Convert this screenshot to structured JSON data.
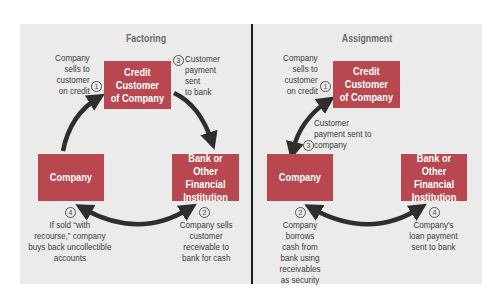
{
  "colors": {
    "box_fill": "#b8474f",
    "box_text": "#ffffff",
    "panel_bg": "#ebebeb",
    "arrow": "#2e2e2e",
    "divider": "#1c1c1c",
    "label_text": "#3b3b3b",
    "title_text": "#6a6a6a"
  },
  "factoring": {
    "title": "Factoring",
    "boxes": {
      "credit_customer": "Credit\nCustomer\nof Company",
      "company": "Company",
      "bank": "Bank or Other\nFinancial\nInstitution"
    },
    "steps": [
      {
        "number": "1",
        "text": "Company\nsells to\ncustomer\non credit"
      },
      {
        "number": "2",
        "text": "Company sells\ncustomer\nreceivable to\nbank for cash"
      },
      {
        "number": "3",
        "text": "Customer\npayment\nsent\nto bank"
      },
      {
        "number": "4",
        "text": "If sold “with\nrecourse,” company\nbuys back uncollectible\naccounts"
      }
    ]
  },
  "assignment": {
    "title": "Assignment",
    "boxes": {
      "credit_customer": "Credit\nCustomer\nof Company",
      "company": "Company",
      "bank": "Bank or Other\nFinancial\nInstitution"
    },
    "steps": [
      {
        "number": "1",
        "text": "Company\nsells to\ncustomer\non credit"
      },
      {
        "number": "2",
        "text": "Company\nborrows\ncash from\nbank using\nreceivables\nas security"
      },
      {
        "number": "3",
        "text": "Customer\npayment sent to\ncompany"
      },
      {
        "number": "4",
        "text": "Company's\nloan payment\nsent to bank"
      }
    ]
  }
}
